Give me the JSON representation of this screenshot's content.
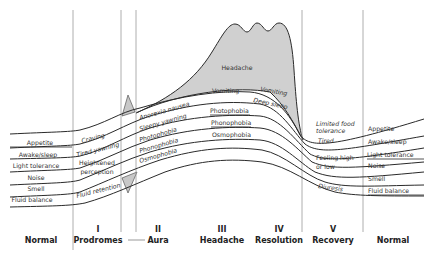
{
  "diagram": {
    "colors": {
      "headache_fill": "#d0d0d0",
      "aura_fill": "#c8c8c8",
      "line": "#2a2a2a",
      "divider": "#9a9a9a"
    },
    "phases": [
      {
        "num": "",
        "name": "Normal"
      },
      {
        "num": "I",
        "name": "Prodromes"
      },
      {
        "num": "II",
        "name": "Aura"
      },
      {
        "num": "III",
        "name": "Headache"
      },
      {
        "num": "IV",
        "name": "Resolution"
      },
      {
        "num": "V",
        "name": "Recovery"
      },
      {
        "num": "",
        "name": "Normal"
      }
    ],
    "left_labels": [
      "Appetite",
      "Awake/sleep",
      "Light tolerance",
      "Noise",
      "Smell",
      "Fluid balance"
    ],
    "right_labels": [
      "Appetite",
      "Awake/sleep",
      "Light tolerance",
      "Noise",
      "Smell",
      "Fluid balance"
    ],
    "prodromes_labels": {
      "craving": "Craving",
      "tired": "Tired yawning",
      "heightened_1": "Heightened",
      "heightened_2": "perception",
      "fluid": "Fluid retention"
    },
    "aura_labels": [
      "Anorexia nausea",
      "Sleepy yawning",
      "Photophobia",
      "Phonophobia",
      "Osmophobia"
    ],
    "headache_labels": {
      "headache": "Headache",
      "vomiting": "Vomiting",
      "photophobia": "Photophobia",
      "phonophobia": "Phonophobia",
      "osmophobia": "Osmophobia"
    },
    "resolution_labels": {
      "vomiting": "Vomiting",
      "deep_sleep": "Deep sleep"
    },
    "recovery_labels": {
      "food_1": "Limited food",
      "food_2": "tolerance",
      "tired": "Tired",
      "feeling_1": "Feeling high",
      "feeling_2": "or low",
      "diuresis": "Diuresis"
    }
  }
}
